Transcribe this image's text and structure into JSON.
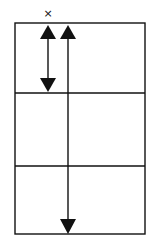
{
  "diagram": {
    "marker": {
      "label": "×",
      "x": 48,
      "y": 13
    },
    "grid": {
      "left": 15,
      "right": 145,
      "top": 23,
      "bottom": 234,
      "dividers_y": [
        93,
        166
      ],
      "stroke_color": "#111111"
    },
    "arrows": [
      {
        "name": "short-double-arrow",
        "x": 48,
        "y1": 25,
        "y2": 92,
        "heads": "both"
      },
      {
        "name": "long-double-arrow",
        "x": 68,
        "y1": 25,
        "y2": 234,
        "heads": "both"
      }
    ]
  }
}
